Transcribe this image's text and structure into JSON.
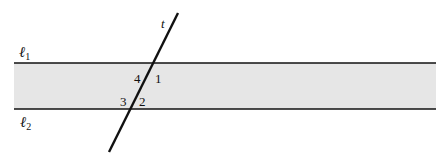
{
  "diagram": {
    "type": "parallel-lines-with-transversal",
    "band_color": "#e6e6e6",
    "line_color": "#111111",
    "lines": {
      "l1": {
        "label": "ℓ",
        "sub": "1"
      },
      "l2": {
        "label": "ℓ",
        "sub": "2"
      },
      "transversal": {
        "label": "t"
      }
    },
    "angles": [
      {
        "id": "1",
        "label": "1"
      },
      {
        "id": "2",
        "label": "2"
      },
      {
        "id": "3",
        "label": "3"
      },
      {
        "id": "4",
        "label": "4"
      }
    ]
  }
}
